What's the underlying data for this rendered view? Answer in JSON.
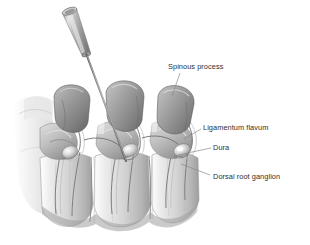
{
  "figure": {
    "style": "grayscale medical line-and-tone illustration",
    "background_color": "#ffffff",
    "ink_color": "#2f2f2f",
    "bone_light_color": "#e8e8e8",
    "bone_mid_color": "#c4c4c4",
    "bone_shadow_color": "#8f8f8f",
    "spinous_process_color": "#9a9a9a",
    "spinous_process_dark_color": "#6f6f6f",
    "needle_color": "#a8a8a8",
    "needle_shaft_color": "#6a6a6a",
    "highlight_color": "#ffffff",
    "leader_line_color": "#8a8a8a"
  },
  "labels": [
    {
      "id": "spinous-process",
      "text": "Spinous process",
      "x": 168,
      "y": 62,
      "leader": {
        "x1": 180,
        "y1": 73,
        "x2": 172,
        "y2": 96
      }
    },
    {
      "id": "ligamentum-flavum",
      "text": "Ligamentum flavum",
      "x": 203,
      "y": 123,
      "leader": {
        "x1": 201,
        "y1": 129,
        "x2": 184,
        "y2": 139
      }
    },
    {
      "id": "dura",
      "text": "Dura",
      "x": 213,
      "y": 143,
      "leader": {
        "x1": 211,
        "y1": 148,
        "x2": 178,
        "y2": 155
      }
    },
    {
      "id": "dorsal-root-ganglion",
      "text": "Dorsal root ganglion",
      "x": 213,
      "y": 172,
      "leader": {
        "x1": 210,
        "y1": 175,
        "x2": 181,
        "y2": 164
      }
    }
  ],
  "needle": {
    "name": "epidural-needle",
    "hub_top": {
      "x": 63,
      "y": 12
    },
    "hub_bottom": {
      "x": 88,
      "y": 57
    },
    "tip": {
      "x": 126,
      "y": 161
    }
  },
  "anatomy": {
    "vertebrae_count": 3,
    "parts": [
      "spinous process",
      "lamina",
      "ligamentum flavum",
      "dura",
      "dorsal root ganglion",
      "vertebral body",
      "intervertebral disc",
      "nerve root"
    ]
  }
}
